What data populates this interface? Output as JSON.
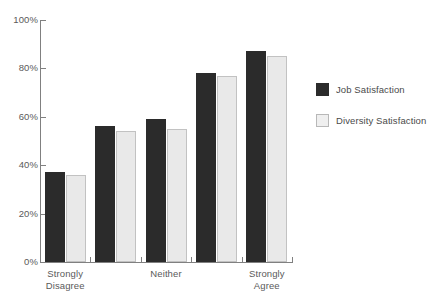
{
  "chart_data": {
    "type": "bar",
    "title": "",
    "xlabel": "",
    "ylabel": "",
    "ylim": [
      0,
      100
    ],
    "ytick_labels": [
      "100%",
      "80%",
      "60%",
      "40%",
      "20%",
      "0%"
    ],
    "ytick_values": [
      100,
      80,
      60,
      40,
      20,
      0
    ],
    "grid": false,
    "legend_position": "right",
    "categories": [
      "Strongly Disagree",
      "",
      "Neither",
      "",
      "Strongly Agree"
    ],
    "category_labels_shown": [
      {
        "line1": "Strongly",
        "line2": "Disagree"
      },
      {
        "line1": "Neither",
        "line2": ""
      },
      {
        "line1": "Strongly",
        "line2": "Agree"
      }
    ],
    "series": [
      {
        "name": "Job Satisfaction",
        "color": "#2b2b2b",
        "values": [
          37,
          56,
          59,
          78,
          87
        ]
      },
      {
        "name": "Diversity Satisfaction",
        "color": "#e9e9e9",
        "values": [
          36,
          54,
          55,
          77,
          85
        ]
      }
    ]
  },
  "legend": {
    "items": [
      {
        "label": "Job Satisfaction",
        "swatch": "dark"
      },
      {
        "label": "Diversity Satisfaction",
        "swatch": "light"
      }
    ]
  },
  "colors": {
    "series_dark": "#2b2b2b",
    "series_light": "#e9e9e9",
    "axis": "#808080",
    "text": "#4a4a4a",
    "background": "#ffffff"
  }
}
